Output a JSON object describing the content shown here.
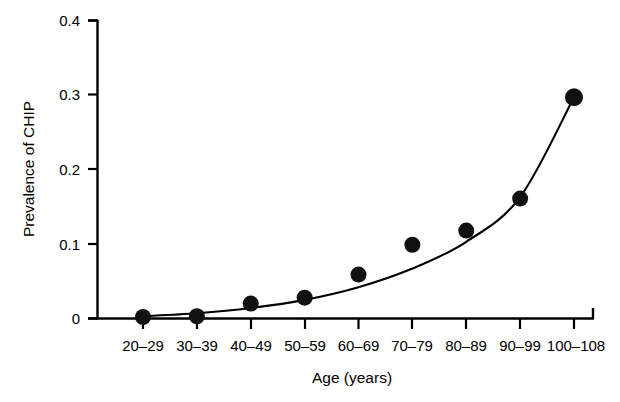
{
  "chart_data": {
    "type": "scatter",
    "title": "",
    "subtitle": "",
    "xlabel": "Age (years)",
    "ylabel": "Prevalence of CHIP",
    "categories": [
      "20–29",
      "30–39",
      "40–49",
      "50–59",
      "60–69",
      "70–79",
      "80–89",
      "90–99",
      "100–108"
    ],
    "values": [
      0.002,
      0.003,
      0.02,
      0.028,
      0.059,
      0.099,
      0.118,
      0.161,
      0.297
    ],
    "series": [
      {
        "name": "Observed prevalence of CHIP",
        "marker": "filled-circle",
        "values": [
          0.002,
          0.003,
          0.02,
          0.028,
          0.059,
          0.099,
          0.118,
          0.161,
          0.297
        ]
      },
      {
        "name": "Fitted exponential trend",
        "marker": "line",
        "values": [
          0.003,
          0.007,
          0.014,
          0.025,
          0.042,
          0.067,
          0.103,
          0.163,
          0.297
        ]
      }
    ],
    "ylim": [
      0,
      0.4
    ],
    "yticks": [
      0,
      0.1,
      0.2,
      0.3,
      0.4
    ],
    "ytick_labels": [
      "0",
      "0.1",
      "0.2",
      "0.3",
      "0.4"
    ],
    "xtick_labels": [
      "20–29",
      "30–39",
      "40–49",
      "50–59",
      "60–69",
      "70–79",
      "80–89",
      "90–99",
      "100–108"
    ],
    "grid": false,
    "legend": "none",
    "legend_position": "none",
    "colors": {
      "point": "#111111",
      "curve": "#000000",
      "axis": "#000000",
      "background": "#ffffff"
    }
  }
}
